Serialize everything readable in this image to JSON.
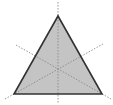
{
  "diagram": {
    "colors": {
      "fill": "#c4c4c4",
      "stroke": "#333333",
      "symmetry_line": "#8a8a8a",
      "background": "#ffffff"
    },
    "triangle": {
      "vertices": [
        {
          "x": 58,
          "y": 16
        },
        {
          "x": 14,
          "y": 94
        },
        {
          "x": 102,
          "y": 94
        }
      ],
      "stroke_width": 1.6
    },
    "centroid": {
      "x": 58,
      "y": 68
    },
    "symmetry_lines": [
      {
        "x1": 58,
        "y1": 2,
        "x2": 58,
        "y2": 104
      },
      {
        "x1": 5,
        "y1": 99,
        "x2": 103,
        "y2": 44
      },
      {
        "x1": 16,
        "y1": 45,
        "x2": 111,
        "y2": 99
      }
    ],
    "symmetry_line_count": 3
  }
}
